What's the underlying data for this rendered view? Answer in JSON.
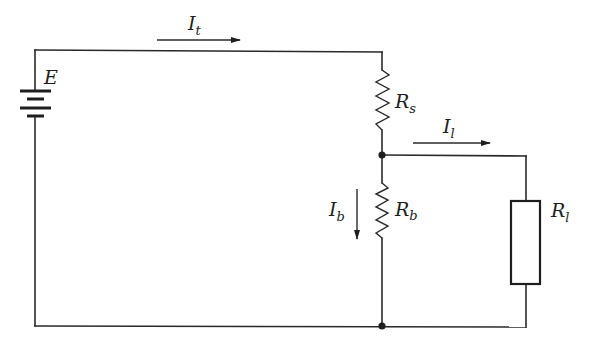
{
  "diagram": {
    "type": "circuit-schematic",
    "source": {
      "label": "E",
      "symbol": "battery"
    },
    "currents": [
      {
        "id": "total",
        "symbol": "I",
        "subscript": "t",
        "direction": "right"
      },
      {
        "id": "load",
        "symbol": "I",
        "subscript": "l",
        "direction": "right"
      },
      {
        "id": "bleeder",
        "symbol": "I",
        "subscript": "b",
        "direction": "down"
      }
    ],
    "resistors": [
      {
        "id": "series",
        "symbol": "R",
        "subscript": "s",
        "style": "zigzag"
      },
      {
        "id": "bleeder",
        "symbol": "R",
        "subscript": "b",
        "style": "zigzag"
      },
      {
        "id": "load",
        "symbol": "R",
        "subscript": "l",
        "style": "box"
      }
    ],
    "nodes": [
      "junction-top",
      "junction-bottom"
    ],
    "colors": {
      "ink": "#1e1e1e",
      "background": "#ffffff"
    }
  }
}
